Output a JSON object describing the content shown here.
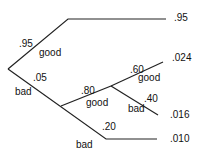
{
  "diagram": {
    "type": "probability-tree",
    "stroke_color": "#222222",
    "text_color": "#111111",
    "branches": {
      "root_good": {
        "probability": ".95",
        "label": "good",
        "outcome": ".95"
      },
      "root_bad": {
        "probability": ".05",
        "label": "bad"
      },
      "bad_good": {
        "probability": ".80",
        "label": "good"
      },
      "bad_good_good": {
        "probability": ".60",
        "label": "good",
        "outcome": ".024"
      },
      "bad_good_bad": {
        "probability": ".40",
        "label": "bad",
        "outcome": ".016"
      },
      "bad_bad": {
        "probability": ".20",
        "label": "bad",
        "outcome": ".010"
      }
    }
  }
}
